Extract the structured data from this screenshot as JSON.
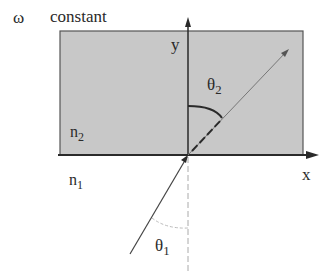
{
  "header": {
    "omega_symbol": "ω",
    "omega_caption": "constant"
  },
  "axes": {
    "x_label": "x",
    "y_label": "y"
  },
  "media": {
    "upper": {
      "label_base": "n",
      "label_sub": "2",
      "fill": "#c8c8c8"
    },
    "lower": {
      "label_base": "n",
      "label_sub": "1",
      "fill": "#ffffff"
    }
  },
  "angles": {
    "refracted": {
      "label_base": "θ",
      "label_sub": "2"
    },
    "incident": {
      "label_base": "θ",
      "label_sub": "1"
    }
  },
  "colors": {
    "ink": "#2a2a2a",
    "ray": "#555555",
    "medium_fill": "#c8c8c8",
    "medium_border": "#555555",
    "normal_dashed": "#aaaaaa"
  }
}
